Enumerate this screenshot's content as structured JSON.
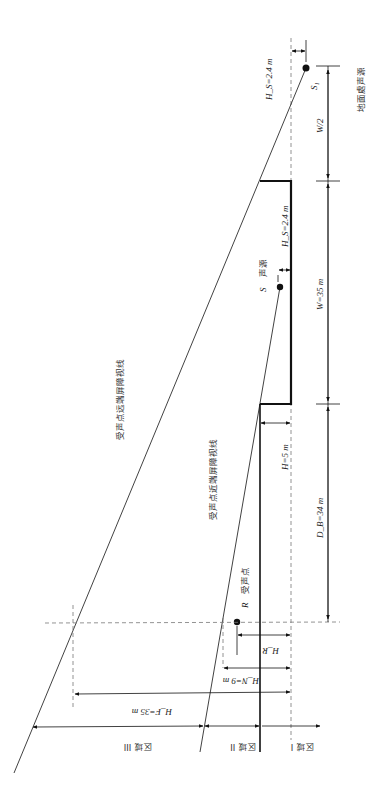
{
  "diagram": {
    "orientation": "rotated 90 degrees clockwise",
    "labels": {
      "ground_source_height": "H_S=2.4 m",
      "ground_source_name": "S₁",
      "ground_source_desc": "地面處声源",
      "half_width": "W/2",
      "source_height": "H_S=2.4 m",
      "source_name": "S",
      "source_desc": "声源",
      "width": "W=35 m",
      "barrier_height": "H=5 m",
      "barrier_distance": "D_B=34 m",
      "far_sightline": "受声点远端屏障视线",
      "near_sightline": "受声点近端屏障视线",
      "receiver_name": "R",
      "receiver_desc": "受声点",
      "receiver_height": "H_R",
      "near_height": "H_N=9 m",
      "far_height": "H_F=35 m",
      "zone_1": "区域 I",
      "zone_2": "区域 II",
      "zone_3": "区域 III"
    },
    "values": {
      "H_S_m": 2.4,
      "W_m": 35,
      "H_m": 5,
      "D_B_m": 34,
      "H_N_m": 9,
      "H_F_m": 35
    },
    "colors": {
      "line": "#111111",
      "dashed": "#777777",
      "text": "#222222"
    }
  }
}
